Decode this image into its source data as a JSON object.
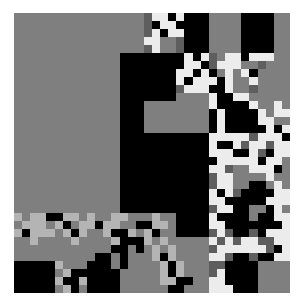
{
  "image": {
    "description": "abstract quadtree-style pixel mosaic",
    "palette": {
      "G": "#7f7f7f",
      "B": "#000000",
      "W": "#ececec",
      "L": "#b4b4b4",
      "D": "#5e5e5e",
      ".": "transparent"
    },
    "grid": {
      "cols": 34,
      "rows": 35,
      "cells": [
        "GGGGGGGGGGGGGGGGDWWBWBBBGGGGBBBBGG",
        "GGGGGGGGGGGGGGGGDBWWBBBBGGGGBBBBGG",
        "GGGGGGGGGGGGGGGGDWBWWBBBGGGGBBBBGG",
        "GGGGGGGGGGGGGGGGWWGGDBBBGGGGBBBBGG",
        "GGGGGGGGGGGGGGGGDWGGDBBBGGGGBBBBGG",
        "GGGGGGGGGGGGGBBBBBBBBWBWDGWWBWWWGG",
        "GGGGGGGGGGGGGBBBBBBBBWWBDWWWGGDGGG",
        "GGGGGGGGGGGGGBBBBBBBWWBWBGWGWBGGGG",
        "GGGGGGGGGGGGGBBBBBBBWBWWWBWGGWGGGG",
        "GGGGGGGGGGGGGBBBBBBBDWWWBBWGGDGGGG",
        "GGGGGGGGGGGGGBBBBBBBGGGGWBBWWGGGGG",
        "GGGGGGGGGGGGGBBBGGGGGGGGWBBBBWGGWG",
        "GGGGGGGGGGGGGBBBGGGGGGGGBWBBBBWGWW",
        "GGGGGGGGGGGGGBBBGGGGGGGGBWBBBBWWGG",
        "GGGGGGGGGGGGGBBBGGGGGGGGBWBBBBBWBW",
        "GGGGGGGGGGGGGBBBBBBBBBBBWWWWWDWWWB",
        "GGGGGGGGGGGGGBBBBBBBBBBBWBBWDWWDWW",
        "GGGGGGGGGGGGGBBBBBBBBBBBWWWBBWDBWW",
        "GGGGGGGGGGGGGBBBBBBBBBBBBWWWWWBWWG",
        "GGGGGGGGGGGGGBBBBBBBBBBBWWDGGWWWBG",
        "GGGGGGGGGGGGGBBBBBBBBBBBDWWGGGGWGG",
        "GGGGGGGGGGGGGBBBBBBBBBBBDWWGGBBGWG",
        "GGGGGGGGGGGGGBBBBBBBBBBBWBWDBBBBWW",
        "GGGGGGGGGGGGGBBBBBBBBBBBWWBBBBBWWW",
        "GGGGGGGGGGGGGBBBBBBBBBBBDWWBBGGBWG",
        "LGLLBBLLGLGGLLGGGLGGBBBBWBBBBGBBWW",
        "GLLLGLBGLLBLLGGBBLLGBBBBWWBBBBBBBW",
        "LBLLLGLBLGGLBBLGLBGGBBBBDWDBBDBWWW",
        "GGLGGGGLGGGGLBBBLGLGGGGGWDWDWWDDWW",
        "GGGGGGGGGGGGBBGBGLGLGGGGDWWWWWWDBW",
        "GGGGGGGGGGBBGBGGGLBLGGGGWWDBBDBBWW",
        "BBBBBLGGGBBBGBGGGGLBLGGGDDBBBBGGGG",
        "BBBBBGLBBBBBBGGGGGLBLGGGDWBBBBGGGG",
        "BBBBBLBBLBBBBGGGGGLLBBGGWWBBBBGGGG",
        "BBBBBGLBGBBBBGGGGGGBBGGGWWWBBBGGGG"
      ]
    }
  }
}
